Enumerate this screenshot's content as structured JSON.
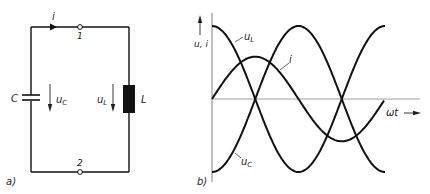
{
  "figure_a": {
    "panel_label": "a)",
    "current_label": "i",
    "node_top": "1",
    "node_bottom": "2",
    "capacitor_label": "C",
    "capacitor_voltage_label": "u",
    "capacitor_voltage_sub": "C",
    "inductor_voltage_label": "u",
    "inductor_voltage_sub": "L",
    "inductor_label": "L"
  },
  "figure_b": {
    "panel_label": "b)",
    "y_axis_label": "u, i",
    "x_axis_label": "ωt",
    "curve_uL_label": "u",
    "curve_uL_sub": "L",
    "curve_i_label": "i",
    "curve_uC_label": "u",
    "curve_uC_sub": "C"
  },
  "chart_data": {
    "type": "line",
    "title": "",
    "xlabel": "ωt",
    "ylabel": "u, i",
    "grid": false,
    "x": [
      0,
      0.5,
      1.0,
      1.5,
      2.0,
      2.5,
      3.0,
      3.5,
      4.0
    ],
    "x_unit": "π rad (approx.)",
    "series": [
      {
        "name": "u_L",
        "values": [
          1,
          0,
          -1,
          0,
          1,
          0,
          -1,
          0,
          1
        ]
      },
      {
        "name": "u_C",
        "values": [
          -1,
          0,
          1,
          0,
          -1,
          0,
          1,
          0,
          -1
        ]
      },
      {
        "name": "i",
        "values": [
          0,
          0.58,
          0,
          -0.58,
          0,
          0.58,
          0,
          -0.58,
          0
        ]
      }
    ],
    "visible_range_x_periods": [
      0,
      1
    ]
  },
  "colors": {
    "ink": "#111111",
    "axis": "#555555",
    "background": "#ffffff"
  }
}
